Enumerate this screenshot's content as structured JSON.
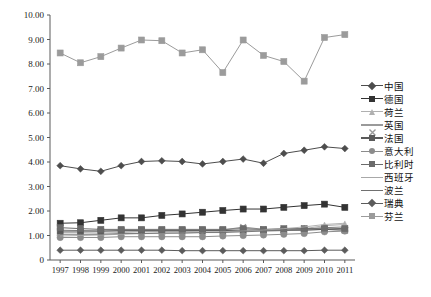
{
  "chart_data": {
    "type": "line",
    "title": "",
    "subtitle": "",
    "xlabel": "",
    "ylabel": "",
    "xlim": [
      1997,
      2011
    ],
    "ylim": [
      0,
      10
    ],
    "grid": false,
    "legend_position": "right",
    "x": [
      1997,
      1998,
      1999,
      2000,
      2001,
      2002,
      2003,
      2004,
      2005,
      2006,
      2007,
      2008,
      2009,
      2010,
      2011
    ],
    "categories": [
      "1997",
      "1998",
      "1999",
      "2000",
      "2001",
      "2002",
      "2003",
      "2004",
      "2005",
      "2006",
      "2007",
      "2008",
      "2009",
      "2010",
      "2011"
    ],
    "ytick_labels": [
      "0",
      "1.00",
      "2.00",
      "3.00",
      "4.00",
      "5.00",
      "6.00",
      "7.00",
      "8.00",
      "9.00",
      "10.00"
    ],
    "ytick_values": [
      0,
      1,
      2,
      3,
      4,
      5,
      6,
      7,
      8,
      9,
      10
    ],
    "series": [
      {
        "name": "中国",
        "marker": "diamond",
        "color": "#4d4d4d",
        "values": [
          3.85,
          3.72,
          3.62,
          3.85,
          4.02,
          4.05,
          4.02,
          3.92,
          4.02,
          4.12,
          3.95,
          4.35,
          4.48,
          4.62,
          4.55
        ]
      },
      {
        "name": "德国",
        "marker": "square",
        "color": "#333333",
        "values": [
          1.5,
          1.52,
          1.62,
          1.72,
          1.72,
          1.82,
          1.88,
          1.95,
          2.02,
          2.08,
          2.08,
          2.15,
          2.22,
          2.28,
          2.15
        ]
      },
      {
        "name": "荷兰",
        "marker": "triangle",
        "color": "#b0b0b0",
        "values": [
          1.12,
          1.12,
          1.1,
          1.12,
          1.15,
          1.15,
          1.15,
          1.15,
          1.15,
          1.18,
          1.2,
          1.22,
          1.28,
          1.4,
          1.45
        ]
      },
      {
        "name": "英国",
        "marker": "x",
        "color": "#9a9a9a",
        "values": [
          1.22,
          1.2,
          1.18,
          1.18,
          1.18,
          1.18,
          1.18,
          1.2,
          1.22,
          1.35,
          1.25,
          1.22,
          1.22,
          1.25,
          1.22
        ]
      },
      {
        "name": "法国",
        "marker": "square",
        "color": "#5a5a5a",
        "values": [
          1.18,
          1.18,
          1.18,
          1.2,
          1.2,
          1.2,
          1.2,
          1.2,
          1.2,
          1.22,
          1.22,
          1.22,
          1.22,
          1.25,
          1.22
        ]
      },
      {
        "name": "意大利",
        "marker": "circle",
        "color": "#8c8c8c",
        "values": [
          0.92,
          0.92,
          0.92,
          0.95,
          0.95,
          0.95,
          0.95,
          0.95,
          0.98,
          1.0,
          1.02,
          1.05,
          1.08,
          1.15,
          1.18
        ]
      },
      {
        "name": "比利时",
        "marker": "square",
        "color": "#6b6b6b",
        "values": [
          1.32,
          1.28,
          1.25,
          1.25,
          1.25,
          1.25,
          1.25,
          1.25,
          1.25,
          1.28,
          1.25,
          1.28,
          1.28,
          1.3,
          1.28
        ]
      },
      {
        "name": "西班牙",
        "marker": "none",
        "color": "#a8a8a8",
        "values": [
          0.98,
          1.0,
          1.02,
          1.05,
          1.08,
          1.08,
          1.1,
          1.12,
          1.15,
          1.18,
          1.22,
          1.28,
          1.35,
          1.45,
          1.5
        ]
      },
      {
        "name": "波兰",
        "marker": "none",
        "color": "#707070",
        "values": [
          1.05,
          1.05,
          1.05,
          1.08,
          1.08,
          1.1,
          1.1,
          1.12,
          1.12,
          1.15,
          1.18,
          1.2,
          1.25,
          1.32,
          1.35
        ]
      },
      {
        "name": "瑞典",
        "marker": "diamond",
        "color": "#5c5c5c",
        "values": [
          0.4,
          0.4,
          0.4,
          0.4,
          0.4,
          0.4,
          0.38,
          0.38,
          0.38,
          0.38,
          0.38,
          0.38,
          0.38,
          0.4,
          0.4
        ]
      },
      {
        "name": "芬兰",
        "marker": "square",
        "color": "#9b9b9b",
        "values": [
          8.45,
          8.05,
          8.3,
          8.65,
          8.98,
          8.95,
          8.45,
          8.58,
          7.65,
          8.98,
          8.35,
          8.1,
          7.3,
          9.08,
          9.2
        ]
      }
    ]
  },
  "axis": {
    "y_ticks": [
      "10.00",
      "9.00",
      "8.00",
      "7.00",
      "6.00",
      "5.00",
      "4.00",
      "3.00",
      "2.00",
      "1.00",
      "0"
    ],
    "x_ticks": [
      "1997",
      "1998",
      "1999",
      "2000",
      "2001",
      "2002",
      "2003",
      "2004",
      "2005",
      "2006",
      "2007",
      "2008",
      "2009",
      "2010",
      "2011"
    ]
  },
  "legend": {
    "items": [
      {
        "label": "中国",
        "marker": "diamond",
        "color": "#4d4d4d"
      },
      {
        "label": "德国",
        "marker": "square",
        "color": "#333333"
      },
      {
        "label": "荷兰",
        "marker": "triangle",
        "color": "#b0b0b0"
      },
      {
        "label": "英国",
        "marker": "x",
        "color": "#9a9a9a"
      },
      {
        "label": "法国",
        "marker": "square",
        "color": "#5a5a5a"
      },
      {
        "label": "意大利",
        "marker": "circle",
        "color": "#8c8c8c"
      },
      {
        "label": "比利时",
        "marker": "square",
        "color": "#6b6b6b"
      },
      {
        "label": "西班牙",
        "marker": "none",
        "color": "#a8a8a8"
      },
      {
        "label": "波兰",
        "marker": "none",
        "color": "#707070"
      },
      {
        "label": "瑞典",
        "marker": "diamond",
        "color": "#5c5c5c"
      },
      {
        "label": "芬兰",
        "marker": "square",
        "color": "#9b9b9b"
      }
    ]
  },
  "colors": {
    "axis": "#5a5a5a",
    "text": "#111111",
    "background": "#ffffff"
  }
}
